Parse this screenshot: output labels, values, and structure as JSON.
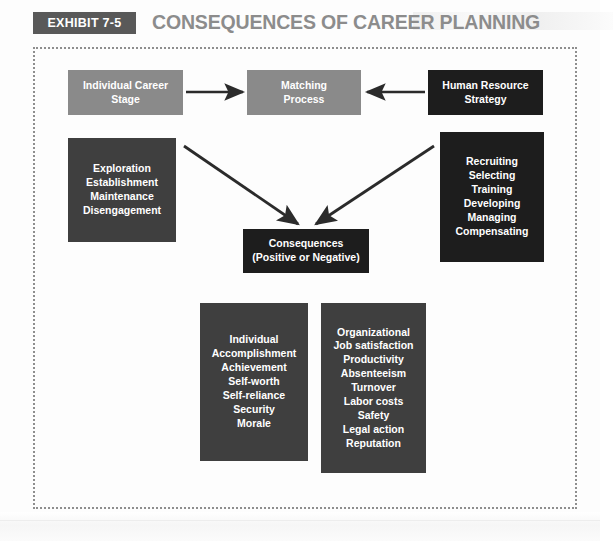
{
  "header": {
    "badge_label": "EXHIBIT 7-5",
    "title": "CONSEQUENCES OF CAREER PLANNING"
  },
  "colors": {
    "badge_bg": "#595959",
    "title_text": "#8c8c8c",
    "box_gray": "#8a8a8a",
    "box_dark": "#3f3f3f",
    "box_black": "#1d1d1d",
    "frame_border": "#8e8e8e",
    "arrow": "#2b2b2b",
    "page_bg": "#fdfdfd"
  },
  "diagram": {
    "boxes": {
      "individual_career_stage": {
        "lines": [
          "Individual Career",
          "Stage"
        ],
        "style": "gray"
      },
      "matching_process": {
        "lines": [
          "Matching",
          "Process"
        ],
        "style": "gray"
      },
      "human_resource_strategy": {
        "lines": [
          "Human Resource",
          "Strategy"
        ],
        "style": "black"
      },
      "career_stages": {
        "lines": [
          "Exploration",
          "Establishment",
          "Maintenance",
          "Disengagement"
        ],
        "style": "dark"
      },
      "hr_activities": {
        "lines": [
          "Recruiting",
          "Selecting",
          "Training",
          "Developing",
          "Managing",
          "Compensating"
        ],
        "style": "black"
      },
      "consequences": {
        "lines": [
          "Consequences",
          "(Positive or Negative)"
        ],
        "style": "black"
      },
      "individual_outcomes": {
        "lines": [
          "Individual",
          "Accomplishment",
          "Achievement",
          "Self-worth",
          "Self-reliance",
          "Security",
          "Morale"
        ],
        "style": "dark"
      },
      "organizational_outcomes": {
        "lines": [
          "Organizational",
          "Job satisfaction",
          "Productivity",
          "Absenteeism",
          "Turnover",
          "Labor costs",
          "Safety",
          "Legal action",
          "Reputation"
        ],
        "style": "dark"
      }
    },
    "arrows": [
      {
        "name": "arrow-career-stage-to-matching",
        "direction": "right"
      },
      {
        "name": "arrow-hr-strategy-to-matching",
        "direction": "left"
      },
      {
        "name": "arrow-career-stages-to-consequences",
        "direction": "down-right"
      },
      {
        "name": "arrow-hr-activities-to-consequences",
        "direction": "down-left"
      }
    ]
  }
}
